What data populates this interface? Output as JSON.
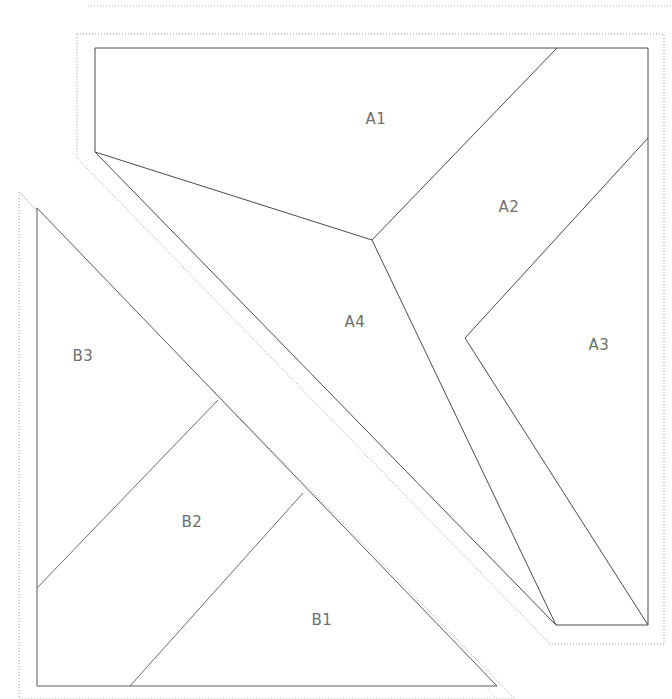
{
  "diagram": {
    "canvas": {
      "width": 672,
      "height": 699,
      "background": "#ffffff"
    },
    "colors": {
      "outline": "#4a4a4a",
      "divider": "#4a4a4a",
      "clearance": "#9a9a9a",
      "clearance_faint": "#b8b8b8",
      "label": "#6e6e6e",
      "background": "#ffffff"
    },
    "parts": [
      {
        "id": "part-a",
        "name": "Part A",
        "outline_points": "95,48 648,48 648,625 556,625 95,152 95,48",
        "clearance_points": "77,34 664,34 664,644 550,644 77,158 77,34",
        "regions": [
          {
            "id": "a1",
            "label": "A1",
            "label_x": 376,
            "label_y": 119
          },
          {
            "id": "a2",
            "label": "A2",
            "label_x": 509,
            "label_y": 207
          },
          {
            "id": "a3",
            "label": "A3",
            "label_x": 599,
            "label_y": 345
          },
          {
            "id": "a4",
            "label": "A4",
            "label_x": 355,
            "label_y": 322
          }
        ],
        "dividers": [
          {
            "id": "a1-a4",
            "points": "95,152 372,240"
          },
          {
            "id": "a1-a2",
            "points": "372,240 557,48"
          },
          {
            "id": "a2-a3",
            "points": "465,338 648,138"
          },
          {
            "id": "a4-boundary",
            "points": "372,240 556,625"
          },
          {
            "id": "a3-boundary",
            "points": "465,338 648,625"
          }
        ]
      },
      {
        "id": "part-b",
        "name": "Part B",
        "outline_points": "37,208 497,686 37,686 37,208",
        "clearance_points": "19,192 19,699 515,699 19,192",
        "regions": [
          {
            "id": "b1",
            "label": "B1",
            "label_x": 322,
            "label_y": 620
          },
          {
            "id": "b2",
            "label": "B2",
            "label_x": 192,
            "label_y": 522
          },
          {
            "id": "b3",
            "label": "B3",
            "label_x": 83,
            "label_y": 356
          }
        ],
        "dividers": [
          {
            "id": "b3-b2",
            "points": "37,588 218,400"
          },
          {
            "id": "b2-b1",
            "points": "130,686 303,493"
          }
        ]
      }
    ],
    "extra_guides": [
      {
        "id": "top-strip-guide",
        "points": "88,6 672,6"
      },
      {
        "id": "part-b-inner-clearance",
        "points": "19,192 497,699"
      }
    ]
  }
}
